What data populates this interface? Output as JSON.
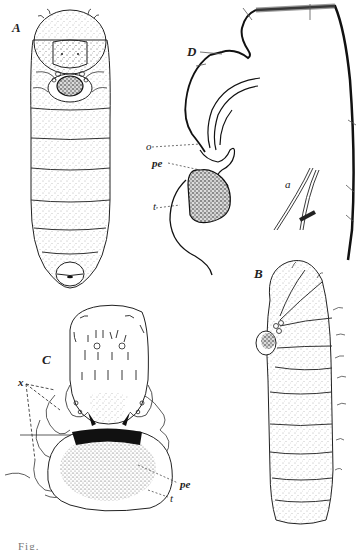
{
  "figure": {
    "panels": [
      {
        "id": "A",
        "label": "A",
        "description": "larva, ventral view"
      },
      {
        "id": "B",
        "label": "B",
        "description": "larva, lateral view"
      },
      {
        "id": "C",
        "label": "C",
        "description": "head region enlarged"
      },
      {
        "id": "D",
        "label": "D",
        "description": "section through anterior end"
      }
    ],
    "annotations": {
      "o": "o",
      "pe_d": "pe",
      "t_d": "t",
      "a": "a",
      "x": "x",
      "pe_c": "pe",
      "t_c": "t"
    },
    "caption_visible": "Fig."
  },
  "colors": {
    "ink": "#1a1a1a",
    "stipple": "#555555",
    "background": "#ffffff"
  }
}
